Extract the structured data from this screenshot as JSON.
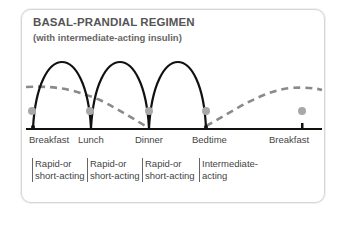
{
  "title": "BASAL-PRANDIAL REGIMEN",
  "subtitle": "(with intermediate-acting insulin)",
  "meals": [
    {
      "label": "Breakfast",
      "x": 33
    },
    {
      "label": "Lunch",
      "x": 91
    },
    {
      "label": "Dinner",
      "x": 149
    },
    {
      "label": "Bedtime",
      "x": 206
    },
    {
      "label": "Breakfast",
      "x": 302
    }
  ],
  "insulin_labels": [
    {
      "line1": "Rapid-or",
      "line2": "short-acting"
    },
    {
      "line1": "Rapid-or",
      "line2": "short-acting"
    },
    {
      "line1": "Rapid-or",
      "line2": "short-acting"
    },
    {
      "line1": "Intermediate-",
      "line2": "acting"
    }
  ],
  "colors": {
    "curve": "#111111",
    "dashed": "#8a8a8a",
    "dot": "#a8a8a8",
    "border": "#d6d6d6"
  }
}
